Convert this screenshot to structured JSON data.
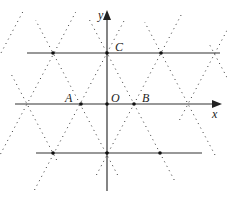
{
  "diagram": {
    "axes": {
      "x_label": "x",
      "y_label": "y"
    },
    "points": [
      {
        "name": "A",
        "label": "A"
      },
      {
        "name": "O",
        "label": "O"
      },
      {
        "name": "B",
        "label": "B"
      },
      {
        "name": "C",
        "label": "C"
      }
    ],
    "colors": {
      "line": "#333333",
      "dotted": "#333333",
      "background": "#ffffff"
    }
  }
}
